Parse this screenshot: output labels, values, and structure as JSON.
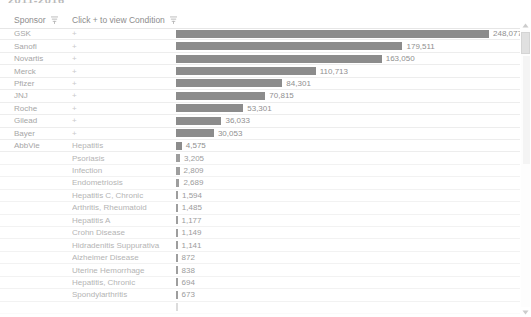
{
  "title": "2011-2016",
  "header": {
    "sponsor_label": "Sponsor",
    "condition_label": "Click + to view Condition",
    "sort_icon": "sort-filter-icon"
  },
  "expander_symbol": "+",
  "scrollbar": {
    "up_icon": "scroll-up-arrow-icon",
    "down_icon": "scroll-down-arrow-icon"
  },
  "chart_data": {
    "type": "bar",
    "title": "2011-2016",
    "xlabel": "",
    "ylabel": "Sponsor",
    "orientation": "horizontal",
    "grid": false,
    "legend": "none",
    "bar_color": "#8c8c8c",
    "max_value": 248077,
    "categories": [
      "GSK",
      "Sanofi",
      "Novartis",
      "Merck",
      "Pfizer",
      "JNJ",
      "Roche",
      "Gilead",
      "Bayer",
      "AbbVie"
    ],
    "values": [
      248077,
      179511,
      163050,
      110713,
      84301,
      70815,
      53301,
      36033,
      30053,
      null
    ],
    "value_labels": [
      "248,077",
      "179,511",
      "163,050",
      "110,713",
      "84,301",
      "70,815",
      "53,301",
      "36,033",
      "30,053",
      ""
    ],
    "expanded_group": {
      "sponsor": "AbbVie",
      "categories": [
        "Hepatitis",
        "Psoriasis",
        "Infection",
        "Endometriosis",
        "Hepatitis C, Chronic",
        "Arthritis, Rheumatoid",
        "Hepatitis A",
        "Crohn Disease",
        "Hidradenitis Suppurativa",
        "Alzheimer Disease",
        "Uterine Hemorrhage",
        "Hepatitis, Chronic",
        "Spondylarthritis"
      ],
      "values": [
        4575,
        3205,
        2809,
        2689,
        1594,
        1485,
        1177,
        1149,
        1141,
        872,
        838,
        694,
        673
      ],
      "value_labels": [
        "4,575",
        "3,205",
        "2,809",
        "2,689",
        "1,594",
        "1,485",
        "1,177",
        "1,149",
        "1,141",
        "872",
        "838",
        "694",
        "673"
      ]
    }
  },
  "rows": [
    {
      "sponsor": "GSK",
      "condition": "",
      "expander": "+",
      "value_label": "248,077",
      "value": 248077,
      "child": false
    },
    {
      "sponsor": "Sanofi",
      "condition": "",
      "expander": "+",
      "value_label": "179,511",
      "value": 179511,
      "child": false
    },
    {
      "sponsor": "Novartis",
      "condition": "",
      "expander": "+",
      "value_label": "163,050",
      "value": 163050,
      "child": false
    },
    {
      "sponsor": "Merck",
      "condition": "",
      "expander": "+",
      "value_label": "110,713",
      "value": 110713,
      "child": false
    },
    {
      "sponsor": "Pfizer",
      "condition": "",
      "expander": "+",
      "value_label": "84,301",
      "value": 84301,
      "child": false
    },
    {
      "sponsor": "JNJ",
      "condition": "",
      "expander": "+",
      "value_label": "70,815",
      "value": 70815,
      "child": false
    },
    {
      "sponsor": "Roche",
      "condition": "",
      "expander": "+",
      "value_label": "53,301",
      "value": 53301,
      "child": false
    },
    {
      "sponsor": "Gilead",
      "condition": "",
      "expander": "+",
      "value_label": "36,033",
      "value": 36033,
      "child": false
    },
    {
      "sponsor": "Bayer",
      "condition": "",
      "expander": "+",
      "value_label": "30,053",
      "value": 30053,
      "child": false
    },
    {
      "sponsor": "AbbVie",
      "condition": "Hepatitis",
      "expander": "",
      "value_label": "4,575",
      "value": 4575,
      "child": false
    },
    {
      "sponsor": "",
      "condition": "Psoriasis",
      "expander": "",
      "value_label": "3,205",
      "value": 3205,
      "child": true
    },
    {
      "sponsor": "",
      "condition": "Infection",
      "expander": "",
      "value_label": "2,809",
      "value": 2809,
      "child": true
    },
    {
      "sponsor": "",
      "condition": "Endometriosis",
      "expander": "",
      "value_label": "2,689",
      "value": 2689,
      "child": true
    },
    {
      "sponsor": "",
      "condition": "Hepatitis C, Chronic",
      "expander": "",
      "value_label": "1,594",
      "value": 1594,
      "child": true
    },
    {
      "sponsor": "",
      "condition": "Arthritis, Rheumatoid",
      "expander": "",
      "value_label": "1,485",
      "value": 1485,
      "child": true
    },
    {
      "sponsor": "",
      "condition": "Hepatitis A",
      "expander": "",
      "value_label": "1,177",
      "value": 1177,
      "child": true
    },
    {
      "sponsor": "",
      "condition": "Crohn Disease",
      "expander": "",
      "value_label": "1,149",
      "value": 1149,
      "child": true
    },
    {
      "sponsor": "",
      "condition": "Hidradenitis Suppurativa",
      "expander": "",
      "value_label": "1,141",
      "value": 1141,
      "child": true
    },
    {
      "sponsor": "",
      "condition": "Alzheimer Disease",
      "expander": "",
      "value_label": "872",
      "value": 872,
      "child": true
    },
    {
      "sponsor": "",
      "condition": "Uterine Hemorrhage",
      "expander": "",
      "value_label": "838",
      "value": 838,
      "child": true
    },
    {
      "sponsor": "",
      "condition": "Hepatitis, Chronic",
      "expander": "",
      "value_label": "694",
      "value": 694,
      "child": true
    },
    {
      "sponsor": "",
      "condition": "Spondylarthritis",
      "expander": "",
      "value_label": "673",
      "value": 673,
      "child": true
    }
  ]
}
